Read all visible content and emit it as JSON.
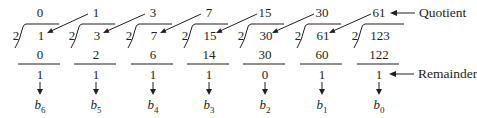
{
  "divisor": "2",
  "columns": [
    {
      "quotient": "0",
      "dividend": "1",
      "product": "0",
      "remainder": "1",
      "bit": "b",
      "bit_sub": "6"
    },
    {
      "quotient": "1",
      "dividend": "3",
      "product": "2",
      "remainder": "1",
      "bit": "b",
      "bit_sub": "5"
    },
    {
      "quotient": "3",
      "dividend": "7",
      "product": "6",
      "remainder": "1",
      "bit": "b",
      "bit_sub": "4"
    },
    {
      "quotient": "7",
      "dividend": "15",
      "product": "14",
      "remainder": "1",
      "bit": "b",
      "bit_sub": "3"
    },
    {
      "quotient": "15",
      "dividend": "30",
      "product": "30",
      "remainder": "0",
      "bit": "b",
      "bit_sub": "2"
    },
    {
      "quotient": "30",
      "dividend": "61",
      "product": "60",
      "remainder": "1",
      "bit": "b",
      "bit_sub": "1"
    },
    {
      "quotient": "61",
      "dividend": "123",
      "product": "122",
      "remainder": "1",
      "bit": "b",
      "bit_sub": "0"
    }
  ],
  "annotations": {
    "quotient_label": "Quotient",
    "remainder_label": "Remainder"
  },
  "colors": {
    "ink": "#231f20",
    "background": "#ffffff"
  }
}
